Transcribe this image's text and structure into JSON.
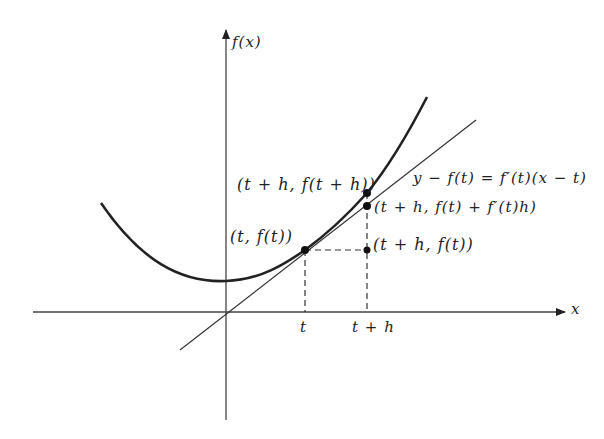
{
  "diagram": {
    "type": "tangent-line-approximation",
    "colors": {
      "ink": "#222222",
      "background": "#ffffff"
    },
    "axes": {
      "x_label": "x",
      "y_label": "f(x)"
    },
    "ticks": {
      "t": "t",
      "t_plus_h": "t + h"
    },
    "points": {
      "p_t": "(t, f(t))",
      "p_t_h_curve": "(t + h, f(t + h))",
      "p_t_h_tangent": "(t + h, f(t) + f′(t)h)",
      "p_t_h_flat": "(t + h, f(t))"
    },
    "tangent_equation": "y − f(t) = f′(t)(x − t)"
  }
}
